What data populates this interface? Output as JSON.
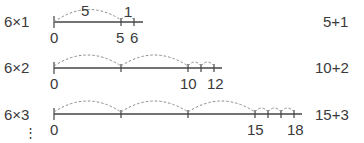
{
  "diagram": {
    "rows": [
      {
        "expression": "6×1",
        "result": "5+1",
        "arc_labels": [
          "5",
          "1"
        ],
        "tick_labels": [
          "0",
          "5",
          "6"
        ]
      },
      {
        "expression": "6×2",
        "result": "10+2",
        "tick_labels": [
          "0",
          "10",
          "12"
        ]
      },
      {
        "expression": "6×3",
        "result": "15+3",
        "tick_labels": [
          "0",
          "15",
          "18"
        ]
      }
    ],
    "continuation": "⋮"
  }
}
